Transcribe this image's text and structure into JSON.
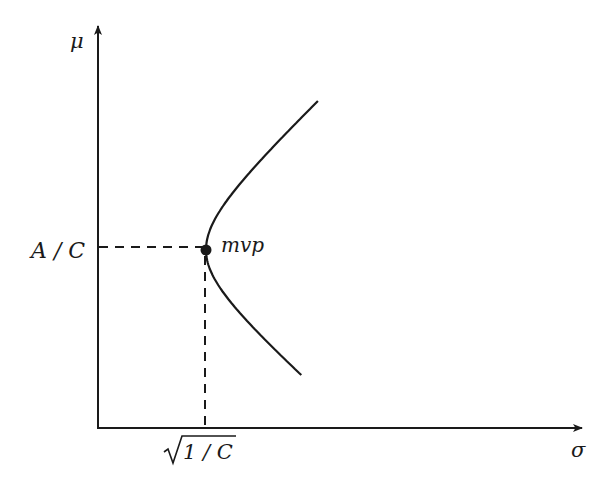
{
  "diagram": {
    "type": "mean-variance frontier",
    "axes": {
      "x": {
        "label": "σ",
        "origin_label": "0"
      },
      "y": {
        "label": "μ"
      }
    },
    "ticks": {
      "x": {
        "label_radicand": "1 / C",
        "label_full": "√(1/C)"
      },
      "y": {
        "label": "A / C"
      }
    },
    "point": {
      "label": "mvp",
      "description": "minimum variance portfolio"
    },
    "curve": {
      "description": "hyperbola opening rightward with vertex at (√(1/C), A/C)"
    },
    "colors": {
      "ink": "#1a1a1a",
      "background": "#ffffff"
    }
  }
}
